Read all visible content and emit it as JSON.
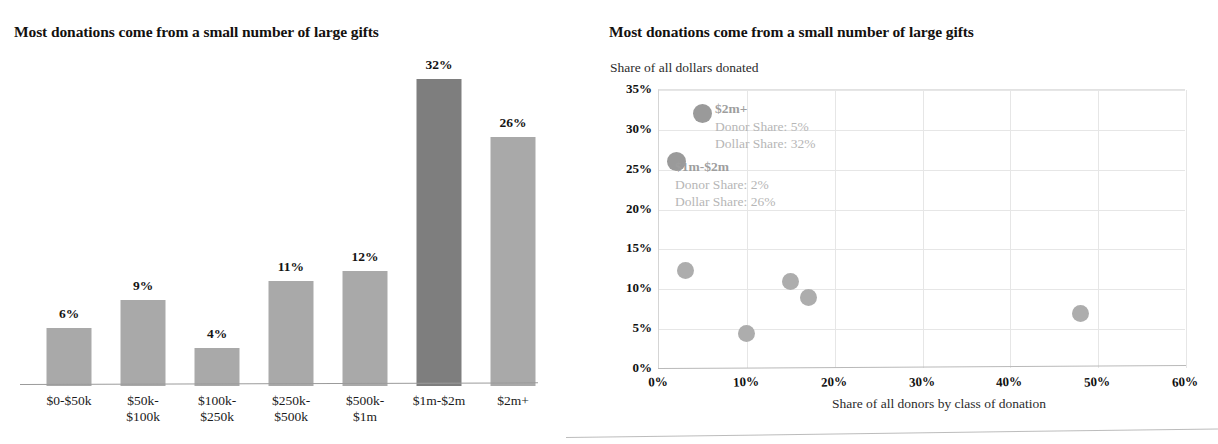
{
  "bar_panel": {
    "title": "Most donations come from a small number of large gifts"
  },
  "scatter_panel": {
    "title": "Most donations come from a small number of large gifts",
    "y_axis_caption": "Share of all dollars donated",
    "x_axis_caption": "Share of all donors by class of donation",
    "annotations": [
      {
        "head": "$2m+",
        "donor_line": "Donor Share: 5%",
        "dollar_line": "Dollar Share: 32%"
      },
      {
        "head": "$1m-$2m",
        "donor_line": "Donor Share: 2%",
        "dollar_line": "Dollar Share: 26%"
      }
    ]
  },
  "chart_data": [
    {
      "type": "bar",
      "title": "Most donations come from a small number of large gifts",
      "xlabel": "",
      "ylabel": "",
      "ylim": [
        0,
        35
      ],
      "grid": false,
      "categories": [
        "$0-$50k",
        "$50k-\n$100k",
        "$100k-\n$250k",
        "$250k-\n$500k",
        "$500k-\n$1m",
        "$1m-$2m",
        "$2m+"
      ],
      "category_lines": [
        [
          "$0-$50k"
        ],
        [
          "$50k-",
          "$100k"
        ],
        [
          "$100k-",
          "$250k"
        ],
        [
          "$250k-",
          "$500k"
        ],
        [
          "$500k-",
          "$1m"
        ],
        [
          "$1m-$2m"
        ],
        [
          "$2m+"
        ]
      ],
      "values": [
        6,
        9,
        4,
        11,
        12,
        32,
        26
      ],
      "value_labels": [
        "6%",
        "9%",
        "4%",
        "11%",
        "12%",
        "32%",
        "26%"
      ],
      "bar_colors": [
        "#a9a9a9",
        "#a9a9a9",
        "#a9a9a9",
        "#a9a9a9",
        "#a9a9a9",
        "#7e7e7e",
        "#a9a9a9"
      ],
      "highlight_index": 5
    },
    {
      "type": "scatter",
      "title": "Most donations come from a small number of large gifts",
      "xlabel": "Share of all donors by class of donation",
      "ylabel": "Share of all dollars donated",
      "xlim": [
        0,
        60
      ],
      "ylim": [
        0,
        35
      ],
      "grid": true,
      "xticks": [
        "0%",
        "10%",
        "20%",
        "30%",
        "40%",
        "50%",
        "60%"
      ],
      "xtick_values": [
        0,
        10,
        20,
        30,
        40,
        50,
        60
      ],
      "yticks": [
        "0%",
        "5%",
        "10%",
        "15%",
        "20%",
        "25%",
        "30%",
        "35%"
      ],
      "ytick_values": [
        0,
        5,
        10,
        15,
        20,
        25,
        30,
        35
      ],
      "points": [
        {
          "label": "$0-$50k",
          "x": 48,
          "y": 7
        },
        {
          "label": "$50k-$100k",
          "x": 17,
          "y": 9
        },
        {
          "label": "$100k-$250k",
          "x": 10,
          "y": 4.5
        },
        {
          "label": "$250k-$500k",
          "x": 15,
          "y": 11
        },
        {
          "label": "$500k-$1m",
          "x": 3,
          "y": 12.3
        },
        {
          "label": "$1m-$2m",
          "x": 2,
          "y": 26
        },
        {
          "label": "$2m+",
          "x": 5,
          "y": 32
        }
      ],
      "point_color": "#adadad"
    }
  ]
}
